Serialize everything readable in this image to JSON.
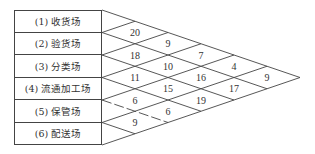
{
  "diagram": {
    "type": "from-to relationship chart (activity relationship triangle)",
    "rows": [
      {
        "label": "(1) 收货场"
      },
      {
        "label": "(2) 验货场"
      },
      {
        "label": "(3) 分类场"
      },
      {
        "label": "(4) 流通加工场"
      },
      {
        "label": "(5) 保管场"
      },
      {
        "label": "(6) 配送场"
      }
    ],
    "cells": [
      {
        "pair": "1-2",
        "value": "20"
      },
      {
        "pair": "2-3",
        "value": "18"
      },
      {
        "pair": "3-4",
        "value": "11"
      },
      {
        "pair": "4-5",
        "value": "6"
      },
      {
        "pair": "5-6",
        "value": "9"
      },
      {
        "pair": "1-3",
        "value": "9"
      },
      {
        "pair": "2-4",
        "value": "10"
      },
      {
        "pair": "3-5",
        "value": "15"
      },
      {
        "pair": "4-6",
        "value": "6"
      },
      {
        "pair": "1-4",
        "value": "7"
      },
      {
        "pair": "2-5",
        "value": "16"
      },
      {
        "pair": "3-6",
        "value": "19"
      },
      {
        "pair": "1-5",
        "value": "4"
      },
      {
        "pair": "2-6",
        "value": "17"
      },
      {
        "pair": "1-6",
        "value": "9"
      }
    ],
    "line_color": "#444444"
  }
}
